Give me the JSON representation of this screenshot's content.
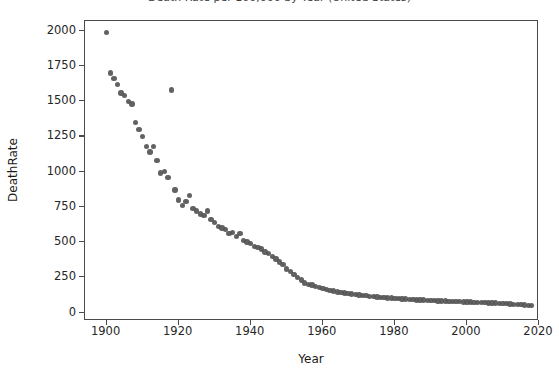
{
  "figure": {
    "background_color": "#ffffff",
    "frame_color": "#4a4a4a",
    "title_clipped": "Death Rate per 100,000 by Year (United States)"
  },
  "chart_data": {
    "type": "scatter",
    "title": "Death Rate per 100,000 by Year (United States)",
    "xlabel": "Year",
    "ylabel": "DeathRate",
    "xlim": [
      1894,
      2020
    ],
    "ylim": [
      -60,
      2070
    ],
    "xticks": [
      1900,
      1920,
      1940,
      1960,
      1980,
      2000,
      2020
    ],
    "yticks": [
      0,
      250,
      500,
      750,
      1000,
      1250,
      1500,
      1750,
      2000
    ],
    "xticklabels": [
      "1900",
      "1920",
      "1940",
      "1960",
      "1980",
      "2000",
      "2020"
    ],
    "yticklabels": [
      "0",
      "250",
      "500",
      "750",
      "1000",
      "1250",
      "1500",
      "1750",
      "2000"
    ],
    "grid": false,
    "legend": null,
    "marker_color": "#555555",
    "marker_size": 5,
    "series": [
      {
        "name": "DeathRate",
        "x": [
          1900,
          1901,
          1902,
          1903,
          1904,
          1905,
          1906,
          1907,
          1908,
          1909,
          1910,
          1911,
          1912,
          1913,
          1914,
          1915,
          1916,
          1917,
          1918,
          1919,
          1920,
          1921,
          1922,
          1923,
          1924,
          1925,
          1926,
          1927,
          1928,
          1929,
          1930,
          1931,
          1932,
          1933,
          1934,
          1935,
          1936,
          1937,
          1938,
          1939,
          1940,
          1941,
          1942,
          1943,
          1944,
          1945,
          1946,
          1947,
          1948,
          1949,
          1950,
          1951,
          1952,
          1953,
          1954,
          1955,
          1956,
          1957,
          1958,
          1959,
          1960,
          1961,
          1962,
          1963,
          1964,
          1965,
          1966,
          1967,
          1968,
          1969,
          1970,
          1971,
          1972,
          1973,
          1974,
          1975,
          1976,
          1977,
          1978,
          1979,
          1980,
          1981,
          1982,
          1983,
          1984,
          1985,
          1986,
          1987,
          1988,
          1989,
          1990,
          1991,
          1992,
          1993,
          1994,
          1995,
          1996,
          1997,
          1998,
          1999,
          2000,
          2001,
          2002,
          2003,
          2004,
          2005,
          2006,
          2007,
          2008,
          2009,
          2010,
          2011,
          2012,
          2013,
          2014,
          2015,
          2016,
          2017,
          2018
        ],
        "y": [
          1990,
          1700,
          1660,
          1620,
          1560,
          1540,
          1500,
          1480,
          1350,
          1300,
          1250,
          1180,
          1140,
          1180,
          1080,
          990,
          1000,
          960,
          1580,
          870,
          800,
          760,
          790,
          830,
          740,
          720,
          700,
          690,
          720,
          660,
          640,
          610,
          600,
          590,
          560,
          570,
          540,
          560,
          510,
          500,
          490,
          470,
          460,
          450,
          430,
          420,
          400,
          380,
          360,
          340,
          310,
          290,
          270,
          250,
          230,
          210,
          200,
          195,
          185,
          178,
          170,
          163,
          157,
          152,
          147,
          143,
          139,
          136,
          132,
          128,
          125,
          122,
          119,
          116,
          113,
          110,
          108,
          106,
          104,
          102,
          100,
          98,
          96,
          95,
          93,
          92,
          90,
          89,
          88,
          86,
          85,
          84,
          83,
          82,
          81,
          80,
          79,
          78,
          77,
          76,
          75,
          74,
          73,
          72,
          71,
          70,
          69,
          68,
          67,
          66,
          64,
          63,
          61,
          59,
          57,
          56,
          54,
          52,
          50
        ]
      }
    ]
  },
  "axis": {
    "x_title": "Year",
    "y_title": "DeathRate"
  }
}
